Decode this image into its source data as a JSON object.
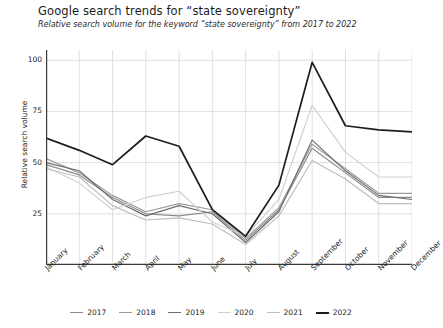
{
  "header": {
    "title": "Google search trends for “state sovereignty”",
    "subtitle": "Relative search volume for the keyword “state sovereignty” from 2017 to 2022"
  },
  "chart_data": {
    "type": "line",
    "title": "Google search trends for “state sovereignty”",
    "subtitle": "Relative search volume for the keyword “state sovereignty” from 2017 to 2022",
    "xlabel": "",
    "ylabel": "Relative search volume",
    "categories": [
      "January",
      "February",
      "March",
      "April",
      "May",
      "June",
      "July",
      "August",
      "September",
      "October",
      "November",
      "December"
    ],
    "ylim": [
      0,
      105
    ],
    "yticks": [
      25,
      50,
      75,
      100
    ],
    "grid": true,
    "legend_position": "bottom",
    "series": [
      {
        "name": "2017",
        "color": "#8a8a8a",
        "values": [
          49,
          44,
          33,
          25,
          24,
          26,
          12,
          27,
          57,
          45,
          33,
          33
        ]
      },
      {
        "name": "2018",
        "color": "#9a9a9a",
        "values": [
          52,
          45,
          34,
          26,
          30,
          27,
          13,
          28,
          59,
          47,
          35,
          35
        ]
      },
      {
        "name": "2019",
        "color": "#6e6e6e",
        "values": [
          50,
          46,
          32,
          24,
          29,
          25,
          11,
          26,
          61,
          46,
          34,
          32
        ]
      },
      {
        "name": "2020",
        "color": "#cfcfcf",
        "values": [
          48,
          40,
          27,
          33,
          36,
          21,
          14,
          32,
          78,
          55,
          43,
          43
        ]
      },
      {
        "name": "2021",
        "color": "#bdbdbd",
        "values": [
          47,
          43,
          29,
          22,
          23,
          20,
          10,
          24,
          51,
          42,
          30,
          30
        ]
      },
      {
        "name": "2022",
        "color": "#1c1c1c",
        "values": [
          62,
          56,
          49,
          63,
          58,
          27,
          14,
          39,
          99,
          68,
          66,
          65
        ]
      }
    ]
  },
  "axis": {
    "y_tick_labels": [
      "100",
      "75",
      "50",
      "25"
    ]
  }
}
